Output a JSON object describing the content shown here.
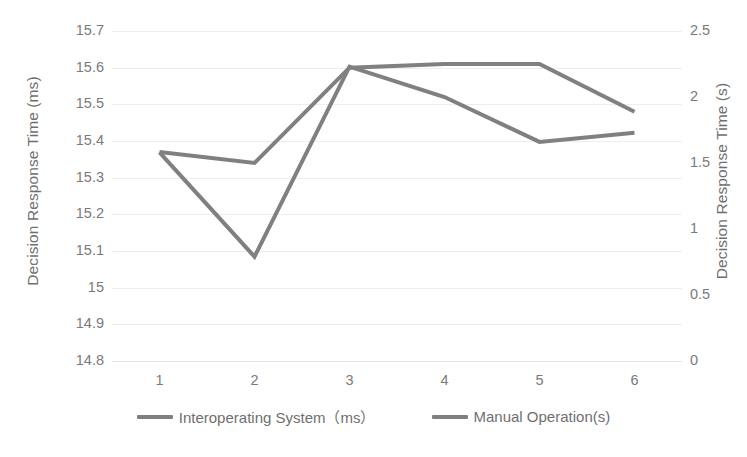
{
  "chart_data": {
    "type": "line",
    "title": "",
    "xlabel": "",
    "ylabel": "Decision Response Time (ms)",
    "y2label": "Decision Response Time (s)",
    "categories": [
      "1",
      "2",
      "3",
      "4",
      "5",
      "6"
    ],
    "grid": true,
    "legend_position": "bottom",
    "y_left": {
      "label": "Decision Response Time (ms)",
      "ticks": [
        "15.7",
        "15.6",
        "15.5",
        "15.4",
        "15.3",
        "15.2",
        "15.1",
        "15",
        "14.9",
        "14.8"
      ],
      "tick_values": [
        15.7,
        15.6,
        15.5,
        15.4,
        15.3,
        15.2,
        15.1,
        15.0,
        14.9,
        14.8
      ],
      "ylim": [
        14.8,
        15.7
      ]
    },
    "y_right": {
      "label": "Decision Response Time (s)",
      "ticks": [
        "2.5",
        "2",
        "1.5",
        "1",
        "0.5",
        "0"
      ],
      "tick_values": [
        2.5,
        2.0,
        1.5,
        1.0,
        0.5,
        0.0
      ],
      "ylim": [
        0,
        2.5
      ]
    },
    "series": [
      {
        "name": "Interoperating System（ms）",
        "axis": "left",
        "unit": "ms",
        "color": "#808080",
        "values": [
          15.37,
          15.34,
          15.6,
          15.61,
          15.61,
          15.48
        ]
      },
      {
        "name": "Manual Operation(s)",
        "axis": "right",
        "unit": "s",
        "color": "#808080",
        "values": [
          1.58,
          0.79,
          2.23,
          2.0,
          1.66,
          1.73
        ]
      }
    ]
  },
  "legend": {
    "items": [
      {
        "label": "Interoperating System（ms）",
        "color": "#808080"
      },
      {
        "label": "Manual Operation(s)",
        "color": "#808080"
      }
    ]
  }
}
